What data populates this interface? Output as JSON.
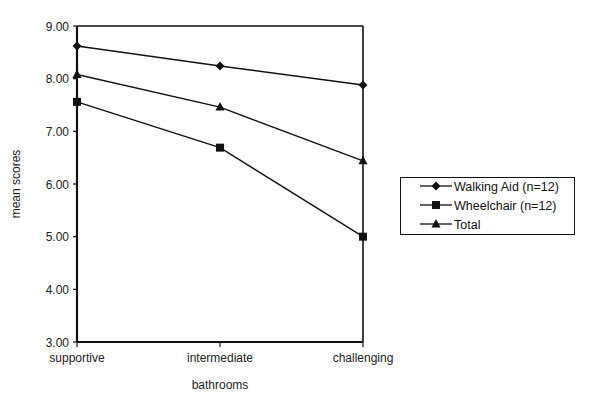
{
  "chart_data": {
    "type": "line",
    "title": "",
    "xlabel": "bathrooms",
    "ylabel": "mean scores",
    "categories": [
      "supportive",
      "intermediate",
      "challenging"
    ],
    "ylim": [
      3.0,
      9.0
    ],
    "yticks": [
      "3.00",
      "4.00",
      "5.00",
      "6.00",
      "7.00",
      "8.00",
      "9.00"
    ],
    "grid": false,
    "legend_position": "right",
    "series": [
      {
        "name": "Walking Aid (n=12)",
        "marker": "diamond",
        "values": [
          8.62,
          8.24,
          7.88
        ]
      },
      {
        "name": "Wheelchair (n=12)",
        "marker": "square",
        "values": [
          7.56,
          6.69,
          5.0
        ]
      },
      {
        "name": "Total",
        "marker": "triangle",
        "values": [
          8.08,
          7.46,
          6.44
        ]
      }
    ]
  },
  "axes": {
    "x_title": "bathrooms",
    "y_title": "mean scores"
  },
  "legend": {
    "items": [
      {
        "label": "Walking Aid (n=12)"
      },
      {
        "label": "Wheelchair (n=12)"
      },
      {
        "label": "Total"
      }
    ]
  },
  "colors": {
    "line": "#111111",
    "background": "#ffffff"
  }
}
